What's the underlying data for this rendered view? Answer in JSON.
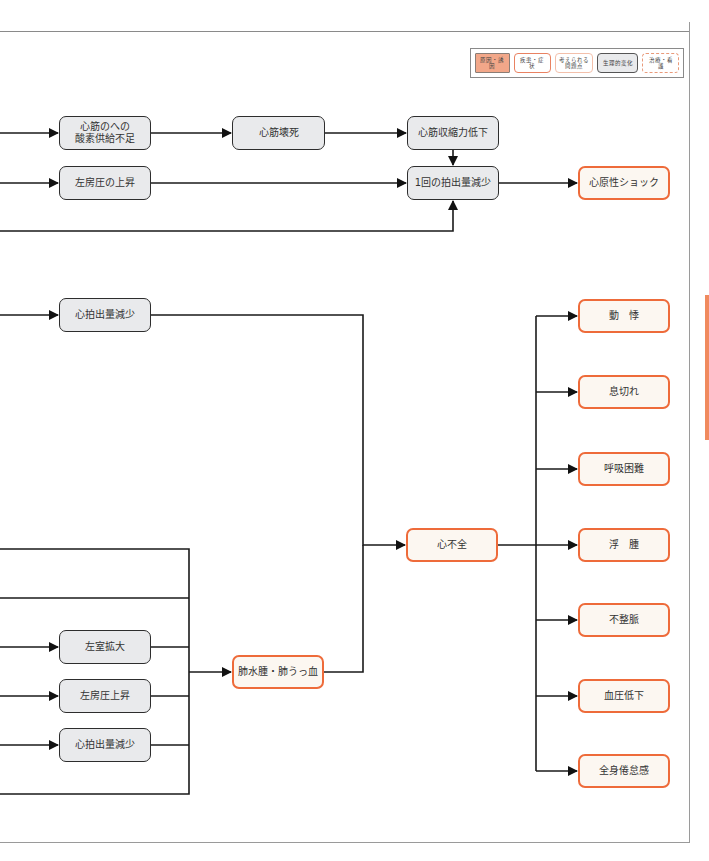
{
  "legend": {
    "items": [
      {
        "key": "cause",
        "label": "原因・誘因",
        "color": "#f2a789"
      },
      {
        "key": "disease",
        "label": "疾患・症状",
        "color": "#e98262"
      },
      {
        "key": "problem",
        "label": "考えられる問題点",
        "color": "#f3c0ab"
      },
      {
        "key": "physio",
        "label": "生理的変化",
        "color": "#e9eaec"
      },
      {
        "key": "care",
        "label": "治療・看護",
        "color": "#e99a7a"
      }
    ]
  },
  "top_section": {
    "oxygen_shortage": "心筋のへの\n酸素供給不足",
    "myocardial_necrosis": "心筋壊死",
    "contractility_decrease": "心筋収縮力低下",
    "la_pressure_rise": "左房圧の上昇",
    "stroke_volume_decrease": "1回の拍出量減少",
    "cardiogenic_shock": "心原性ショック"
  },
  "middle_section": {
    "cardiac_output_decrease": "心拍出量減少",
    "heart_failure": "心不全"
  },
  "lower_section": {
    "lv_dilation": "左室拡大",
    "la_pressure_rise": "左房圧上昇",
    "cardiac_output_decrease": "心拍出量減少",
    "pulmonary_edema": "肺水腫・肺うっ血"
  },
  "symptoms": [
    "動　悸",
    "息切れ",
    "呼吸困難",
    "浮　腫",
    "不整脈",
    "血圧低下",
    "全身倦怠感"
  ],
  "colors": {
    "physio_fill": "#e9eaec",
    "physio_border": "#2d2d2d",
    "disease_fill": "#fcf7f1",
    "disease_border": "#ee6b3a",
    "side_tab": "#f08a5e"
  }
}
